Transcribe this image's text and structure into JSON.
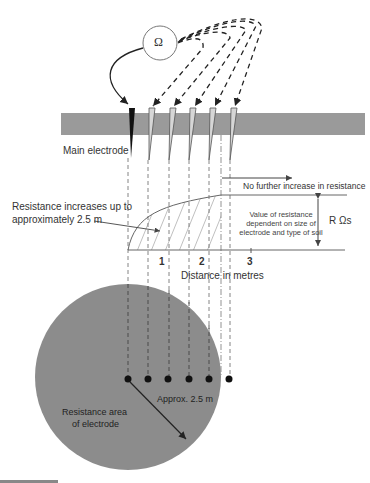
{
  "diagram": {
    "meter_symbol": "Ω",
    "labels": {
      "main_electrode": "Main electrode",
      "no_further_increase": "No further increase in resistance",
      "resistance_increases_line1": "Resistance increases up to",
      "resistance_increases_line2": "approximately 2.5 m",
      "value_dependent_line1": "Value of resistance",
      "value_dependent_line2": "dependent on size of",
      "value_dependent_line3": "electrode and type of soil",
      "r_ohms": "R Ωs",
      "distance_axis": "Distance in metres",
      "approx_radius": "Approx. 2.5 m",
      "resistance_area_line1": "Resistance area",
      "resistance_area_line2": "of electrode"
    },
    "axis_ticks": [
      "1",
      "2",
      "3"
    ],
    "colors": {
      "ground": "#9a9a9a",
      "resistance_area": "#8c8c8c",
      "line": "#555555",
      "electrode_main": "#111111",
      "electrode_test": "#cfcfcf"
    }
  }
}
